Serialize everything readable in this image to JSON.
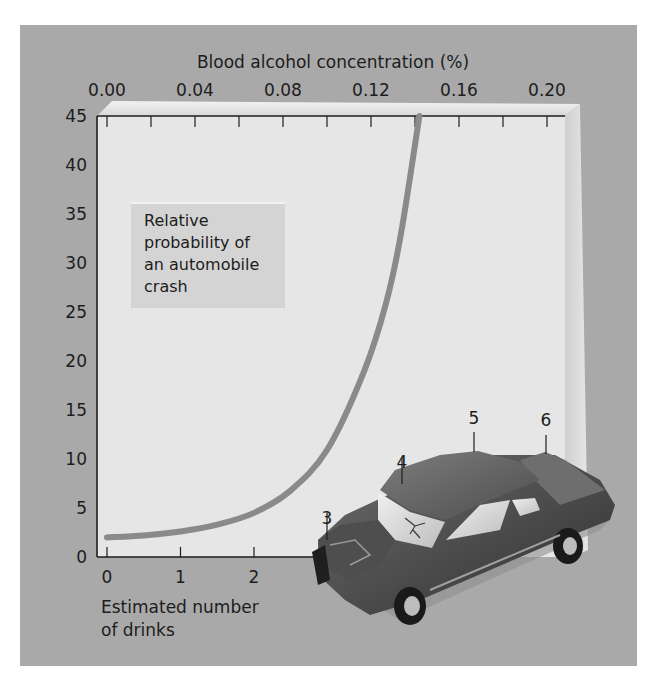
{
  "chart_data": {
    "type": "line",
    "title": "Relative probability of an automobile crash",
    "annotation_box": [
      "Relative",
      "probability of",
      "an automobile",
      "crash"
    ],
    "xlabel": [
      "Estimated number",
      "of drinks"
    ],
    "xlabel_top": "Blood alcohol concentration (%)",
    "ylabel": "",
    "x_ticks": [
      "0",
      "1",
      "2"
    ],
    "x_ticks_on_car": [
      "3",
      "4",
      "5",
      "6"
    ],
    "x_top_ticks": [
      "0.00",
      "0.04",
      "0.08",
      "0.12",
      "0.16",
      "0.20"
    ],
    "y_ticks": [
      "0",
      "5",
      "10",
      "15",
      "20",
      "25",
      "30",
      "35",
      "40",
      "45"
    ],
    "xlim": [
      0,
      6
    ],
    "ylim": [
      0,
      45
    ],
    "x_top_lim": [
      0.0,
      0.2
    ],
    "grid": false,
    "legend": "none",
    "series": [
      {
        "name": "Relative probability of an automobile crash",
        "x": [
          0,
          0.5,
          1,
          1.5,
          2,
          2.5,
          3,
          3.5,
          3.8,
          4.0,
          4.25
        ],
        "values": [
          2,
          2.2,
          2.6,
          3.3,
          4.5,
          6.8,
          11,
          19,
          26,
          33,
          45
        ]
      }
    ],
    "colors": {
      "panel_background": "#a9a9a9",
      "plot_background": "#e6e6e6",
      "curve": "#8a8a8a",
      "axis": "#1d1d1d"
    }
  },
  "illustration": {
    "description": "Crashed car with tick labels 3, 4, 5, 6 marking the front bumper, windshield, roof, and trunk",
    "car_labels": [
      "3",
      "4",
      "5",
      "6"
    ]
  }
}
